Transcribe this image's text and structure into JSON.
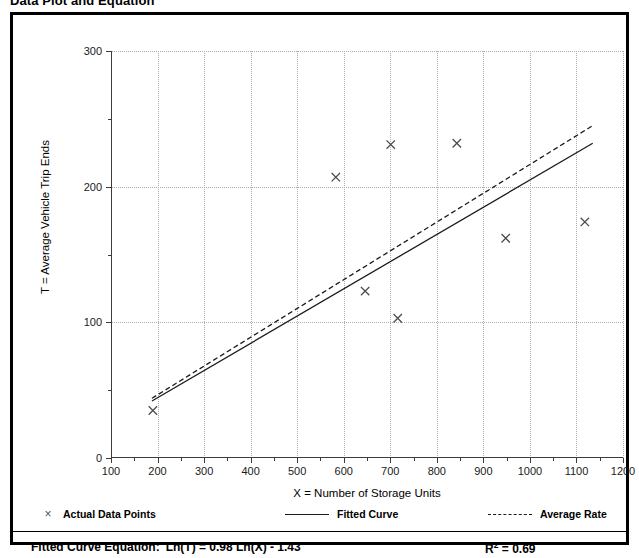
{
  "figure": {
    "title": "Data Plot and Equation"
  },
  "chart_data": {
    "type": "scatter",
    "title": "Data Plot and Equation",
    "xlabel": "X = Number of Storage Units",
    "ylabel": "T = Average Vehicle Trip Ends",
    "xlim": [
      100,
      1200
    ],
    "ylim": [
      0,
      300
    ],
    "x_ticks": [
      100,
      200,
      300,
      400,
      500,
      600,
      700,
      800,
      900,
      1000,
      1100,
      1200
    ],
    "y_ticks": [
      0,
      100,
      200,
      300
    ],
    "y_minor_ticks": [
      50,
      150,
      250
    ],
    "grid": true,
    "grid_style": "dotted",
    "grid_color": "#adadad",
    "legend_position": "below-axes",
    "series": [
      {
        "name": "Actual Data Points",
        "type": "scatter",
        "marker": "x",
        "color": "#4d4d4d",
        "points": [
          {
            "x": 190,
            "y": 35
          },
          {
            "x": 583,
            "y": 207
          },
          {
            "x": 646,
            "y": 123
          },
          {
            "x": 701,
            "y": 231
          },
          {
            "x": 716,
            "y": 103
          },
          {
            "x": 843,
            "y": 232
          },
          {
            "x": 948,
            "y": 162
          },
          {
            "x": 1118,
            "y": 174
          }
        ]
      },
      {
        "name": "Fitted Curve",
        "type": "line",
        "style": "solid",
        "color": "#1a1a1a",
        "points": [
          {
            "x": 188,
            "y": 42
          },
          {
            "x": 1135,
            "y": 232
          }
        ]
      },
      {
        "name": "Average Rate",
        "type": "line",
        "style": "dashed",
        "color": "#1a1a1a",
        "points": [
          {
            "x": 188,
            "y": 44
          },
          {
            "x": 1135,
            "y": 245
          }
        ]
      }
    ]
  },
  "legend": {
    "items": [
      {
        "label": "Actual Data Points",
        "marker": "×"
      },
      {
        "label": "Fitted Curve",
        "marker": "solid-line"
      },
      {
        "label": "Average Rate",
        "marker": "dashed-line"
      }
    ]
  },
  "equation": {
    "caption": "Fitted Curve Equation:",
    "formula": "Ln(T) = 0.98 Ln(X) - 1.43",
    "r_squared_label": "R",
    "r_squared_exponent": "2",
    "r_squared_value": "= 0.69"
  }
}
